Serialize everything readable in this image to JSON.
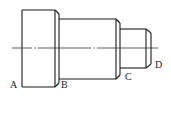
{
  "diagram": {
    "type": "technical-drawing",
    "colors": {
      "stroke": "#1a1a1a",
      "centerline": "#333333",
      "background": "#ffffff",
      "label": "#222222"
    },
    "labels": [
      {
        "id": "A",
        "text": "A",
        "x": 10,
        "y": 80
      },
      {
        "id": "B",
        "text": "B",
        "x": 61,
        "y": 80
      },
      {
        "id": "C",
        "text": "C",
        "x": 125,
        "y": 72
      },
      {
        "id": "D",
        "text": "D",
        "x": 155,
        "y": 60
      }
    ],
    "sections": [
      {
        "name": "large-collar",
        "x1": 22,
        "x2": 55,
        "y_top": 10,
        "y_bottom": 87
      },
      {
        "name": "middle-shaft",
        "x1": 59,
        "x2": 116,
        "y_top": 19,
        "y_bottom": 79
      },
      {
        "name": "small-shaft",
        "x1": 120,
        "x2": 146,
        "y_top": 29,
        "y_bottom": 68
      }
    ],
    "centerline": {
      "y": 48,
      "x1": 12,
      "x2": 158,
      "style": "dash-dot"
    }
  }
}
